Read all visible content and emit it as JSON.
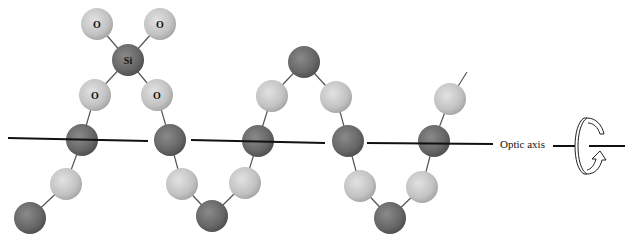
{
  "figure": {
    "axis_label": "Optic axis",
    "rotation_icon": "rotation-arrow-icon",
    "colors": {
      "silicon": "#6e6e6e",
      "oxygen": "#c8c8c8",
      "bond": "#555555",
      "axis": "#111111",
      "background": "#ffffff"
    },
    "labels": {
      "o1": "O",
      "o2": "O",
      "si": "Si",
      "o3": "O",
      "o4": "O"
    },
    "atoms": [
      {
        "type": "O",
        "x": 97,
        "y": 24,
        "label": "O"
      },
      {
        "type": "O",
        "x": 160,
        "y": 24,
        "label": "O"
      },
      {
        "type": "Si",
        "x": 128,
        "y": 60,
        "label": "Si"
      },
      {
        "type": "O",
        "x": 95,
        "y": 95,
        "label": "O"
      },
      {
        "type": "O",
        "x": 157,
        "y": 95,
        "label": "O"
      },
      {
        "type": "Si",
        "x": 82,
        "y": 140
      },
      {
        "type": "O",
        "x": 66,
        "y": 184
      },
      {
        "type": "Si",
        "x": 30,
        "y": 218
      },
      {
        "type": "Si",
        "x": 170,
        "y": 140
      },
      {
        "type": "O",
        "x": 182,
        "y": 184
      },
      {
        "type": "Si",
        "x": 212,
        "y": 216
      },
      {
        "type": "O",
        "x": 245,
        "y": 183
      },
      {
        "type": "Si",
        "x": 258,
        "y": 141
      },
      {
        "type": "O",
        "x": 272,
        "y": 96
      },
      {
        "type": "Si",
        "x": 304,
        "y": 62
      },
      {
        "type": "O",
        "x": 336,
        "y": 97
      },
      {
        "type": "Si",
        "x": 348,
        "y": 141
      },
      {
        "type": "O",
        "x": 360,
        "y": 186
      },
      {
        "type": "Si",
        "x": 390,
        "y": 218
      },
      {
        "type": "O",
        "x": 422,
        "y": 187
      },
      {
        "type": "Si",
        "x": 434,
        "y": 141
      },
      {
        "type": "O",
        "x": 450,
        "y": 99
      }
    ]
  }
}
